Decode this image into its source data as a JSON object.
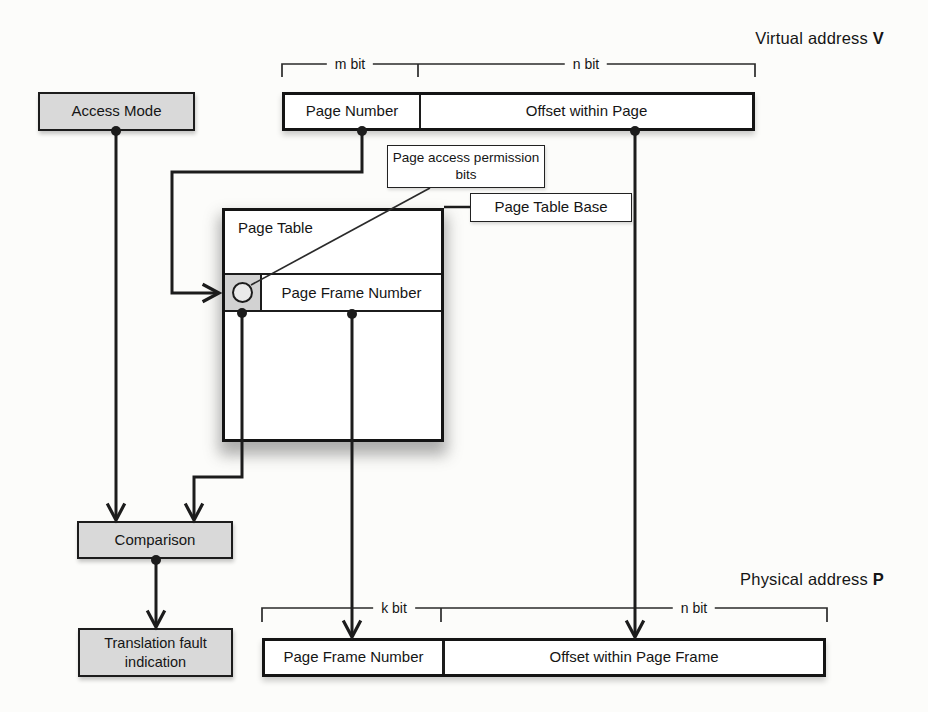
{
  "colors": {
    "background": "#fcfcfa",
    "line": "#1c1c1c",
    "box_fill_gray": "#d9d9d9",
    "box_fill_white": "#ffffff",
    "circle_cell_fill": "#d2d2d2"
  },
  "titles": {
    "virtual_address": "Virtual address ",
    "virtual_address_symbol": "V",
    "physical_address": "Physical address ",
    "physical_address_symbol": "P"
  },
  "virtual_word": {
    "m_bit_label": "m bit",
    "n_bit_label": "n bit",
    "page_number": "Page Number",
    "offset": "Offset within Page"
  },
  "physical_word": {
    "k_bit_label": "k bit",
    "n_bit_label": "n bit",
    "page_frame_number": "Page Frame Number",
    "offset": "Offset within Page Frame"
  },
  "nodes": {
    "access_mode": "Access Mode",
    "comparison": "Comparison",
    "translation_fault": "Translation fault indication",
    "page_table": "Page Table",
    "page_table_entry": "Page Frame Number",
    "page_access_permission": "Page access permission bits",
    "page_table_base": "Page Table Base"
  }
}
